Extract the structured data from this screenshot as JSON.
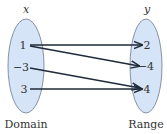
{
  "diagram": {
    "type": "mapping",
    "domain": {
      "variable": "x",
      "caption": "Domain",
      "values": [
        "1",
        "−3",
        "3"
      ]
    },
    "range": {
      "variable": "y",
      "caption": "Range",
      "values": [
        "2",
        "−4",
        "4"
      ]
    },
    "mappings": [
      {
        "from": "1",
        "to": "2"
      },
      {
        "from": "1",
        "to": "−4"
      },
      {
        "from": "−3",
        "to": "4"
      },
      {
        "from": "3",
        "to": "4"
      }
    ],
    "colors": {
      "ellipse_fill": "#d6e4f7",
      "ellipse_stroke": "#6c7a8c",
      "arrow": "#1f2a3a",
      "text": "#333333"
    }
  }
}
